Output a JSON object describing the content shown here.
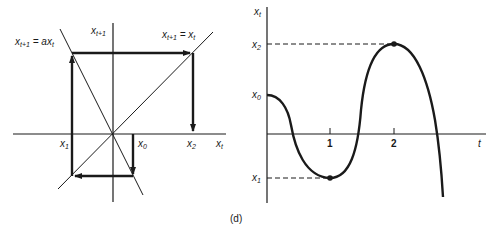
{
  "left_diagram": {
    "labels": {
      "line_a": "x_{t+1} = a x_t",
      "line_a_main": "x",
      "line_a_sub": "t+1",
      "line_a_eq": " = ax",
      "line_a_sub2": "t",
      "vertical_axis": "x",
      "vertical_axis_sub": "t+1",
      "diagonal": "x_{t+1} = x_t",
      "diag_main": "x",
      "diag_sub": "t+1",
      "diag_eq": " = x",
      "diag_sub2": "t",
      "x1": "x",
      "x1_sub": "1",
      "x0": "x",
      "x0_sub": "0",
      "x2": "x",
      "x2_sub": "2",
      "horizontal_axis": "x",
      "horizontal_axis_sub": "t"
    }
  },
  "right_diagram": {
    "labels": {
      "y_axis": "x",
      "y_axis_sub": "t",
      "x2": "x",
      "x2_sub": "2",
      "x0": "x",
      "x0_sub": "0",
      "x1": "x",
      "x1_sub": "1",
      "t_axis": "t",
      "tick_1": "1",
      "tick_2": "2"
    }
  },
  "caption": "(d)",
  "colors": {
    "ink": "#1a1a1a",
    "background": "#ffffff"
  }
}
